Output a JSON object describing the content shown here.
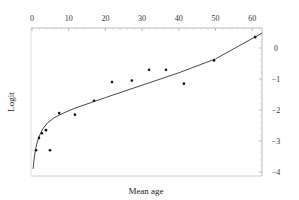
{
  "chart_data": {
    "type": "scatter",
    "title": "",
    "xlabel": "Mean age",
    "ylabel": "Logit",
    "xlim": [
      0,
      64
    ],
    "ylim": [
      -4,
      0.6
    ],
    "x_ticks": [
      0,
      10,
      20,
      30,
      40,
      50,
      60
    ],
    "y_ticks": [
      0,
      -1,
      -2,
      -3,
      -4
    ],
    "x_tick_labels": [
      "0",
      "10",
      "20",
      "30",
      "40",
      "50",
      "60"
    ],
    "y_tick_labels": [
      "0",
      "−1",
      "−2",
      "−3",
      "−4"
    ],
    "x_axis_position": "top",
    "y_axis_position": "right",
    "grid": false,
    "legend": null,
    "series": [
      {
        "name": "observed",
        "kind": "scatter",
        "x": [
          1.1,
          1.9,
          2.7,
          3.8,
          4.9,
          7.4,
          11.7,
          16.9,
          21.8,
          27.2,
          31.9,
          36.5,
          41.4,
          49.6,
          60.8
        ],
        "y": [
          -3.3,
          -2.9,
          -2.75,
          -2.65,
          -3.3,
          -2.1,
          -2.15,
          -1.7,
          -1.1,
          -1.05,
          -0.7,
          -0.7,
          -1.15,
          -0.4,
          0.35
        ]
      },
      {
        "name": "fitted curve",
        "kind": "line",
        "x": [
          0.3,
          0.6,
          1.0,
          1.5,
          2.2,
          3.0,
          4.2,
          6.0,
          8.5,
          12,
          20,
          30,
          40,
          50,
          62.7
        ],
        "y": [
          -3.9,
          -3.55,
          -3.25,
          -3.0,
          -2.78,
          -2.6,
          -2.42,
          -2.25,
          -2.1,
          -1.93,
          -1.6,
          -1.2,
          -0.8,
          -0.35,
          0.48
        ]
      }
    ]
  }
}
